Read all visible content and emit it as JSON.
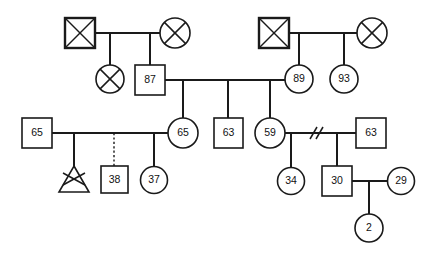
{
  "diagram": {
    "kind": "genogram",
    "title": "",
    "background_color": "#ffffff",
    "line_color": "#1a1a1a",
    "text_color": "#111111",
    "generations": 4
  },
  "legend": {
    "square_meaning": "male",
    "circle_meaning": "female",
    "triangle_meaning": "pregnancy",
    "x_overlay_meaning": "deceased",
    "double_slash_meaning": "divorced",
    "dashed_line_meaning": "adopted-or-foster"
  },
  "nodes": [
    {
      "id": "g1-m1",
      "shape": "square",
      "sex": "male",
      "label": "",
      "deceased": true,
      "heavy": true,
      "cx": 80,
      "cy": 33,
      "size": 30
    },
    {
      "id": "g1-f1",
      "shape": "circle",
      "sex": "female",
      "label": "",
      "deceased": true,
      "heavy": false,
      "cx": 175,
      "cy": 33,
      "size": 30
    },
    {
      "id": "g1-m2",
      "shape": "square",
      "sex": "male",
      "label": "",
      "deceased": true,
      "heavy": true,
      "cx": 274,
      "cy": 33,
      "size": 30
    },
    {
      "id": "g1-f2",
      "shape": "circle",
      "sex": "female",
      "label": "",
      "deceased": true,
      "heavy": false,
      "cx": 372,
      "cy": 33,
      "size": 30
    },
    {
      "id": "g2-f0",
      "shape": "circle",
      "sex": "female",
      "label": "",
      "deceased": true,
      "heavy": false,
      "cx": 98,
      "cy": 79,
      "size": 28
    },
    {
      "id": "g2-m1",
      "shape": "square",
      "sex": "male",
      "label": "87",
      "deceased": false,
      "heavy": false,
      "cx": 150,
      "cy": 80,
      "size": 30
    },
    {
      "id": "g2-f1",
      "shape": "circle",
      "sex": "female",
      "label": "89",
      "deceased": false,
      "heavy": false,
      "cx": 299,
      "cy": 79,
      "size": 28
    },
    {
      "id": "g2-f2",
      "shape": "circle",
      "sex": "female",
      "label": "93",
      "deceased": false,
      "heavy": false,
      "cx": 344,
      "cy": 79,
      "size": 28
    },
    {
      "id": "g3-m0",
      "shape": "square",
      "sex": "male",
      "label": "65",
      "deceased": false,
      "heavy": false,
      "cx": 37,
      "cy": 133,
      "size": 30
    },
    {
      "id": "g3-f1",
      "shape": "circle",
      "sex": "female",
      "label": "65",
      "deceased": false,
      "heavy": false,
      "cx": 183,
      "cy": 133,
      "size": 30
    },
    {
      "id": "g3-m1",
      "shape": "square",
      "sex": "male",
      "label": "63",
      "deceased": false,
      "heavy": false,
      "cx": 228,
      "cy": 133,
      "size": 30
    },
    {
      "id": "g3-f2",
      "shape": "circle",
      "sex": "female",
      "label": "59",
      "deceased": false,
      "heavy": false,
      "cx": 270,
      "cy": 133,
      "size": 30
    },
    {
      "id": "g3-m2",
      "shape": "square",
      "sex": "male",
      "label": "63",
      "deceased": false,
      "heavy": false,
      "cx": 371,
      "cy": 133,
      "size": 30
    },
    {
      "id": "g4-p1",
      "shape": "triangle",
      "sex": "pregnancy",
      "label": "",
      "deceased": true,
      "heavy": false,
      "cx": 74,
      "cy": 180,
      "size": 30
    },
    {
      "id": "g4-m1",
      "shape": "square",
      "sex": "male",
      "label": "38",
      "deceased": false,
      "heavy": false,
      "cx": 114,
      "cy": 180,
      "size": 28
    },
    {
      "id": "g4-f1",
      "shape": "circle",
      "sex": "female",
      "label": "37",
      "deceased": false,
      "heavy": false,
      "cx": 154,
      "cy": 180,
      "size": 28
    },
    {
      "id": "g4-f2",
      "shape": "circle",
      "sex": "female",
      "label": "34",
      "deceased": false,
      "heavy": false,
      "cx": 291,
      "cy": 181,
      "size": 28
    },
    {
      "id": "g4-m2",
      "shape": "square",
      "sex": "male",
      "label": "30",
      "deceased": false,
      "heavy": false,
      "cx": 337,
      "cy": 181,
      "size": 30
    },
    {
      "id": "g4-f3",
      "shape": "circle",
      "sex": "female",
      "label": "29",
      "deceased": false,
      "heavy": false,
      "cx": 401,
      "cy": 181,
      "size": 28
    },
    {
      "id": "g5-f1",
      "shape": "circle",
      "sex": "female",
      "label": "2",
      "deceased": false,
      "heavy": false,
      "cx": 369,
      "cy": 228,
      "size": 28
    }
  ],
  "unions": [
    {
      "id": "u1",
      "partners": [
        "g1-m1",
        "g1-f1"
      ],
      "y": 33,
      "x1": 95,
      "x2": 160,
      "divorced": false,
      "children": [
        "g2-f0",
        "g2-m1"
      ]
    },
    {
      "id": "u2",
      "partners": [
        "g1-m2",
        "g1-f2"
      ],
      "y": 33,
      "x1": 289,
      "x2": 357,
      "divorced": false,
      "children": [
        "g2-f1",
        "g2-f2"
      ]
    },
    {
      "id": "u3",
      "partners": [
        "g2-m1",
        "g2-f1"
      ],
      "y": 80,
      "x1": 165,
      "x2": 285,
      "divorced": false,
      "children": [
        "g3-f1",
        "g3-m1",
        "g3-f2"
      ]
    },
    {
      "id": "u4",
      "partners": [
        "g3-m0",
        "g3-f1"
      ],
      "y": 133,
      "x1": 52,
      "x2": 168,
      "divorced": false,
      "children": [
        "g4-p1",
        "g4-m1",
        "g4-f1"
      ]
    },
    {
      "id": "u5",
      "partners": [
        "g3-f2",
        "g3-m2"
      ],
      "y": 133,
      "x1": 285,
      "x2": 356,
      "divorced": true,
      "children": [
        "g4-f2",
        "g4-m2"
      ]
    },
    {
      "id": "u6",
      "partners": [
        "g4-m2",
        "g4-f3"
      ],
      "y": 181,
      "x1": 352,
      "x2": 387,
      "divorced": false,
      "children": [
        "g5-f1"
      ]
    }
  ],
  "child_links": [
    {
      "from_union": "u1",
      "to": "g2-f0",
      "style": "solid",
      "drop_x": 110,
      "sib_y": 56,
      "child_top_y": 65
    },
    {
      "from_union": "u1",
      "to": "g2-m1",
      "style": "solid",
      "drop_x": 150,
      "sib_y": 48,
      "child_top_y": 65
    },
    {
      "from_union": "u2",
      "to": "g2-f1",
      "style": "solid",
      "drop_x": 299,
      "sib_y": 48,
      "child_top_y": 65
    },
    {
      "from_union": "u2",
      "to": "g2-f2",
      "style": "solid",
      "drop_x": 344,
      "sib_y": 48,
      "child_top_y": 65
    },
    {
      "from_union": "u3",
      "to": "g3-f1",
      "style": "solid",
      "drop_x": 183,
      "sib_y": 80,
      "child_top_y": 118
    },
    {
      "from_union": "u3",
      "to": "g3-m1",
      "style": "solid",
      "drop_x": 228,
      "sib_y": 80,
      "child_top_y": 118
    },
    {
      "from_union": "u3",
      "to": "g3-f2",
      "style": "solid",
      "drop_x": 270,
      "sib_y": 80,
      "child_top_y": 118
    },
    {
      "from_union": "u4",
      "to": "g4-p1",
      "style": "solid",
      "drop_x": 74,
      "sib_y": 133,
      "child_top_y": 166
    },
    {
      "from_union": "u4",
      "to": "g4-m1",
      "style": "dashed",
      "drop_x": 114,
      "sib_y": 133,
      "child_top_y": 166
    },
    {
      "from_union": "u4",
      "to": "g4-f1",
      "style": "solid",
      "drop_x": 154,
      "sib_y": 133,
      "child_top_y": 167
    },
    {
      "from_union": "u5",
      "to": "g4-f2",
      "style": "solid",
      "drop_x": 291,
      "sib_y": 133,
      "child_top_y": 167
    },
    {
      "from_union": "u5",
      "to": "g4-m2",
      "style": "solid",
      "drop_x": 337,
      "sib_y": 133,
      "child_top_y": 166
    },
    {
      "from_union": "u6",
      "to": "g5-f1",
      "style": "solid",
      "drop_x": 369,
      "sib_y": 181,
      "child_top_y": 214
    }
  ],
  "labels": {
    "n_87": "87",
    "n_89": "89",
    "n_93": "93",
    "n_65_male": "65",
    "n_65_female": "65",
    "n_63_sib": "63",
    "n_59": "59",
    "n_63_spouse": "63",
    "n_38": "38",
    "n_37": "37",
    "n_34": "34",
    "n_30": "30",
    "n_29": "29",
    "n_2": "2"
  }
}
